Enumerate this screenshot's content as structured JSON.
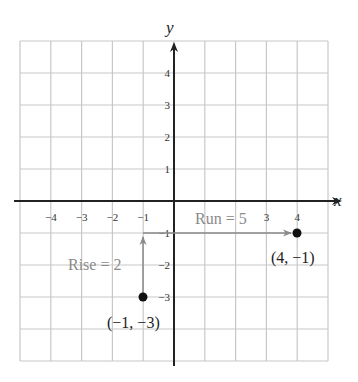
{
  "graph": {
    "x_axis_label": "x",
    "y_axis_label": "y",
    "x_ticks": [
      {
        "value": -4,
        "label": "−4"
      },
      {
        "value": -3,
        "label": "−3"
      },
      {
        "value": -2,
        "label": "−2"
      },
      {
        "value": -1,
        "label": "−1"
      },
      {
        "value": 3,
        "label": "3"
      },
      {
        "value": 4,
        "label": "4"
      }
    ],
    "y_ticks": [
      {
        "value": 4,
        "label": "4"
      },
      {
        "value": 3,
        "label": "3"
      },
      {
        "value": 2,
        "label": "2"
      },
      {
        "value": 1,
        "label": "1"
      },
      {
        "value": -1,
        "label": "−1"
      },
      {
        "value": -2,
        "label": "−2"
      },
      {
        "value": -3,
        "label": "−3"
      }
    ],
    "x_range": [
      -5,
      5
    ],
    "y_range": [
      -5,
      5
    ],
    "grid": true,
    "points": [
      {
        "x": -1,
        "y": -3,
        "label": "(−1, −3)"
      },
      {
        "x": 4,
        "y": -1,
        "label": "(4, −1)"
      }
    ],
    "rise": {
      "label": "Rise = 2",
      "from": [
        -1,
        -3
      ],
      "to": [
        -1,
        -1
      ]
    },
    "run": {
      "label": "Run = 5",
      "from": [
        -1,
        -1
      ],
      "to": [
        4,
        -1
      ]
    },
    "colors": {
      "grid": "#c8c8c8",
      "axis": "#222222",
      "annotation": "#8a8a8a",
      "point": "#111111"
    }
  }
}
